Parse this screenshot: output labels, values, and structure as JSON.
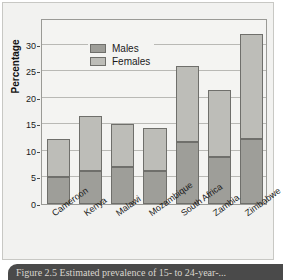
{
  "figure": {
    "caption": "Figure 2.5 Estimated prevalence of 15- to 24-year-..."
  },
  "chart_data": {
    "type": "bar",
    "stacked": true,
    "title": "",
    "xlabel": "",
    "ylabel": "Percentage",
    "ylim": [
      0,
      35
    ],
    "yticks": [
      0,
      5,
      10,
      15,
      20,
      25,
      30
    ],
    "ytick_labels": [
      "0",
      "5",
      "10",
      "15",
      "20",
      "25",
      "30"
    ],
    "grid": true,
    "legend_position": "top-left",
    "categories": [
      "Cameroon",
      "Kenya",
      "Malawi",
      "Mozambique",
      "South Africa",
      "Zambia",
      "Zimbabwe"
    ],
    "series": [
      {
        "name": "Males",
        "color": "#9e9e99",
        "values": [
          5.0,
          6.2,
          7.0,
          6.3,
          11.6,
          8.9,
          12.3
        ]
      },
      {
        "name": "Females",
        "color": "#bdbdb8",
        "values": [
          7.2,
          10.3,
          8.1,
          8.0,
          14.4,
          12.6,
          19.7
        ]
      }
    ],
    "totals": [
      12.2,
      16.5,
      15.1,
      14.3,
      26.0,
      21.5,
      32.0
    ]
  }
}
